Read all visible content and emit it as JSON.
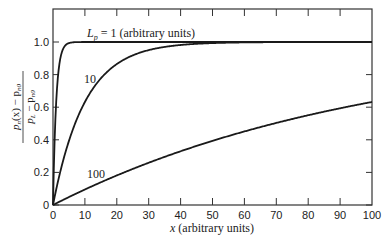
{
  "chart_data": {
    "type": "line",
    "title": "",
    "xlabel": "x (arbitrary units)",
    "ylabel": "(p_n(x) − p_n0) / (p_L − p_n0)",
    "ylabel_numerator": "p_n(x) − p_n0",
    "ylabel_denominator": "p_L − p_n0",
    "xlim": [
      0,
      100
    ],
    "ylim": [
      0,
      1.2
    ],
    "x_ticks": [
      0,
      10,
      20,
      30,
      40,
      50,
      60,
      70,
      80,
      90,
      100
    ],
    "y_ticks": [
      0,
      0.2,
      0.4,
      0.6,
      0.8,
      1.0
    ],
    "y_tick_labels": [
      "0",
      "0.2",
      "0.4",
      "0.6",
      "0.8",
      "1.0"
    ],
    "grid": false,
    "legend": "none (inline curve labels)",
    "x": [
      0,
      1,
      2,
      3,
      4,
      5,
      10,
      20,
      30,
      40,
      50,
      60,
      70,
      80,
      90,
      100
    ],
    "series": [
      {
        "name": "L_p = 1 (arbitrary units)",
        "label": "L_p = 1 (arbitrary units)",
        "L": 1,
        "values": [
          0,
          0.63,
          0.86,
          0.95,
          0.98,
          0.99,
          1.0,
          1.0,
          1.0,
          1.0,
          1.0,
          1.0,
          1.0,
          1.0,
          1.0,
          1.0
        ]
      },
      {
        "name": "10",
        "label": "10",
        "L": 10,
        "values": [
          0,
          0.1,
          0.18,
          0.26,
          0.33,
          0.39,
          0.63,
          0.86,
          0.95,
          0.98,
          0.99,
          1.0,
          1.0,
          1.0,
          1.0,
          1.0
        ]
      },
      {
        "name": "100",
        "label": "100",
        "L": 100,
        "values": [
          0,
          0.01,
          0.02,
          0.03,
          0.04,
          0.05,
          0.1,
          0.18,
          0.26,
          0.33,
          0.39,
          0.45,
          0.5,
          0.55,
          0.59,
          0.63
        ]
      }
    ]
  },
  "labels": {
    "curve1_prefix": "L",
    "curve1_sub": "p",
    "curve1_rest": " = 1 (arbitrary units)",
    "curve2": "10",
    "curve3": "100",
    "xlabel": "x (arbitrary units)",
    "ylabel_num": "p",
    "ylabel_num_sub": "n",
    "ylabel_num_rest": "(x) − p",
    "ylabel_num_sub2": "n0",
    "ylabel_den": "p",
    "ylabel_den_sub": "L",
    "ylabel_den_rest": " − p",
    "ylabel_den_sub2": "n0"
  }
}
